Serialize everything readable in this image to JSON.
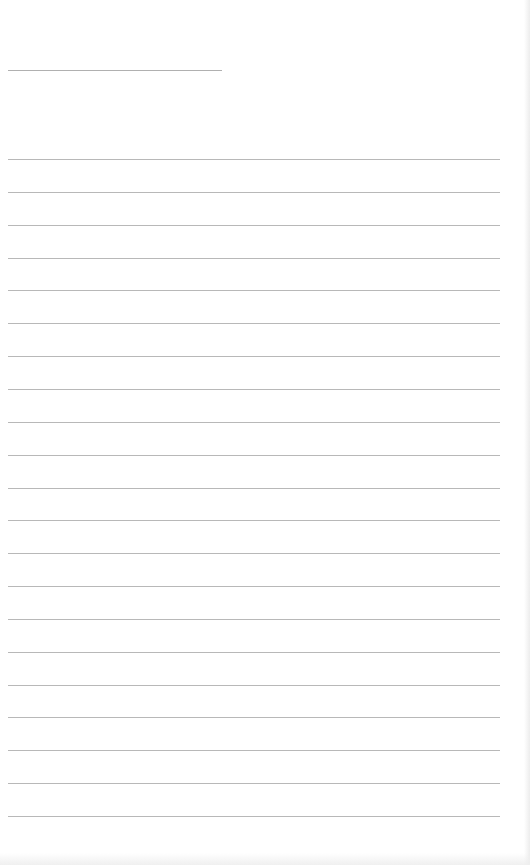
{
  "document": {
    "type": "blank-lined-page",
    "title_line": {
      "x": 8,
      "y": 70,
      "width": 214,
      "color": "#b0b0b0"
    },
    "ruled_lines": {
      "count": 21,
      "start_y": 159,
      "spacing": 32.85,
      "x": 8,
      "width": 492,
      "color": "#b8b8b8"
    },
    "text_content": []
  }
}
